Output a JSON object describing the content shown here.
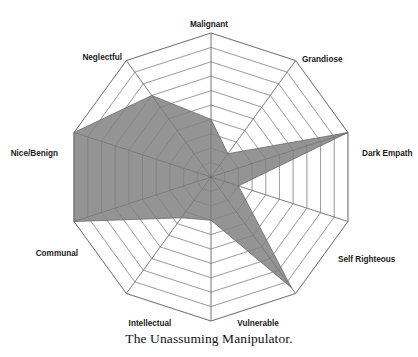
{
  "caption": "The Unassuming Manipulator.",
  "colors": {
    "fill": "#8b8b8b",
    "grid": "#9a9a9a",
    "background": "#ffffff",
    "text": "#1a1a1a"
  },
  "chart_data": {
    "type": "radar",
    "title": "The Unassuming Manipulator.",
    "categories": [
      "Malignant",
      "Grandiose",
      "Dark Empath",
      "Self Righteous",
      "Vulnerable",
      "Intellectual",
      "Communal",
      "Nice/Benign",
      "Neglectful",
      "Manipulative"
    ],
    "values": [
      4,
      2,
      10,
      2,
      9.5,
      3,
      3.5,
      10,
      10,
      7
    ],
    "series": [
      {
        "name": "The Unassuming Manipulator",
        "values": [
          4,
          2,
          10,
          2,
          9.5,
          3,
          3.5,
          10,
          10,
          7
        ]
      }
    ],
    "rlim": [
      0,
      10
    ],
    "rings": 10,
    "grid": true,
    "legend": "none",
    "xlabel": "",
    "ylabel": "",
    "tick_labels": []
  },
  "labels": {
    "malignant": "Malignant",
    "grandiose": "Grandiose",
    "dark_empath": "Dark Empath",
    "self_righteous": "Self Righteous",
    "vulnerable": "Vulnerable",
    "intellectual": "Intellectual",
    "communal": "Communal",
    "nice_benign": "Nice/Benign",
    "neglectful": "Neglectful"
  }
}
